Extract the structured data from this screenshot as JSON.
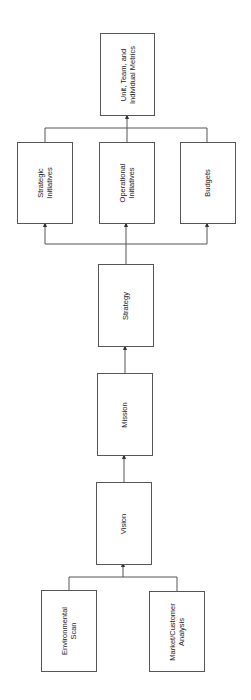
{
  "diagram": {
    "orientation": "rotated-90-ccw",
    "nodes": [
      {
        "id": "metrics",
        "label": "Unit, Team, and\nIndividual Metrics"
      },
      {
        "id": "strategic",
        "label": "Strategic\nInitiatives"
      },
      {
        "id": "operational",
        "label": "Operational\nInitiatives"
      },
      {
        "id": "budgets",
        "label": "Budgets"
      },
      {
        "id": "strategy",
        "label": "Strategy"
      },
      {
        "id": "mission",
        "label": "Mission"
      },
      {
        "id": "vision",
        "label": "Vision"
      },
      {
        "id": "envscan",
        "label": "Environmental\nScan"
      },
      {
        "id": "market",
        "label": "Market/Customer\nAnalysis"
      }
    ],
    "edges": [
      {
        "from": "envscan",
        "to": "vision"
      },
      {
        "from": "market",
        "to": "vision"
      },
      {
        "from": "vision",
        "to": "mission"
      },
      {
        "from": "mission",
        "to": "strategy"
      },
      {
        "from": "strategy",
        "to": "strategic"
      },
      {
        "from": "strategy",
        "to": "operational"
      },
      {
        "from": "strategy",
        "to": "budgets"
      },
      {
        "from": "strategic",
        "to": "metrics"
      },
      {
        "from": "operational",
        "to": "metrics"
      },
      {
        "from": "budgets",
        "to": "metrics"
      }
    ],
    "colors": {
      "line": "#555555",
      "text": "#222222",
      "background": "#ffffff"
    }
  }
}
